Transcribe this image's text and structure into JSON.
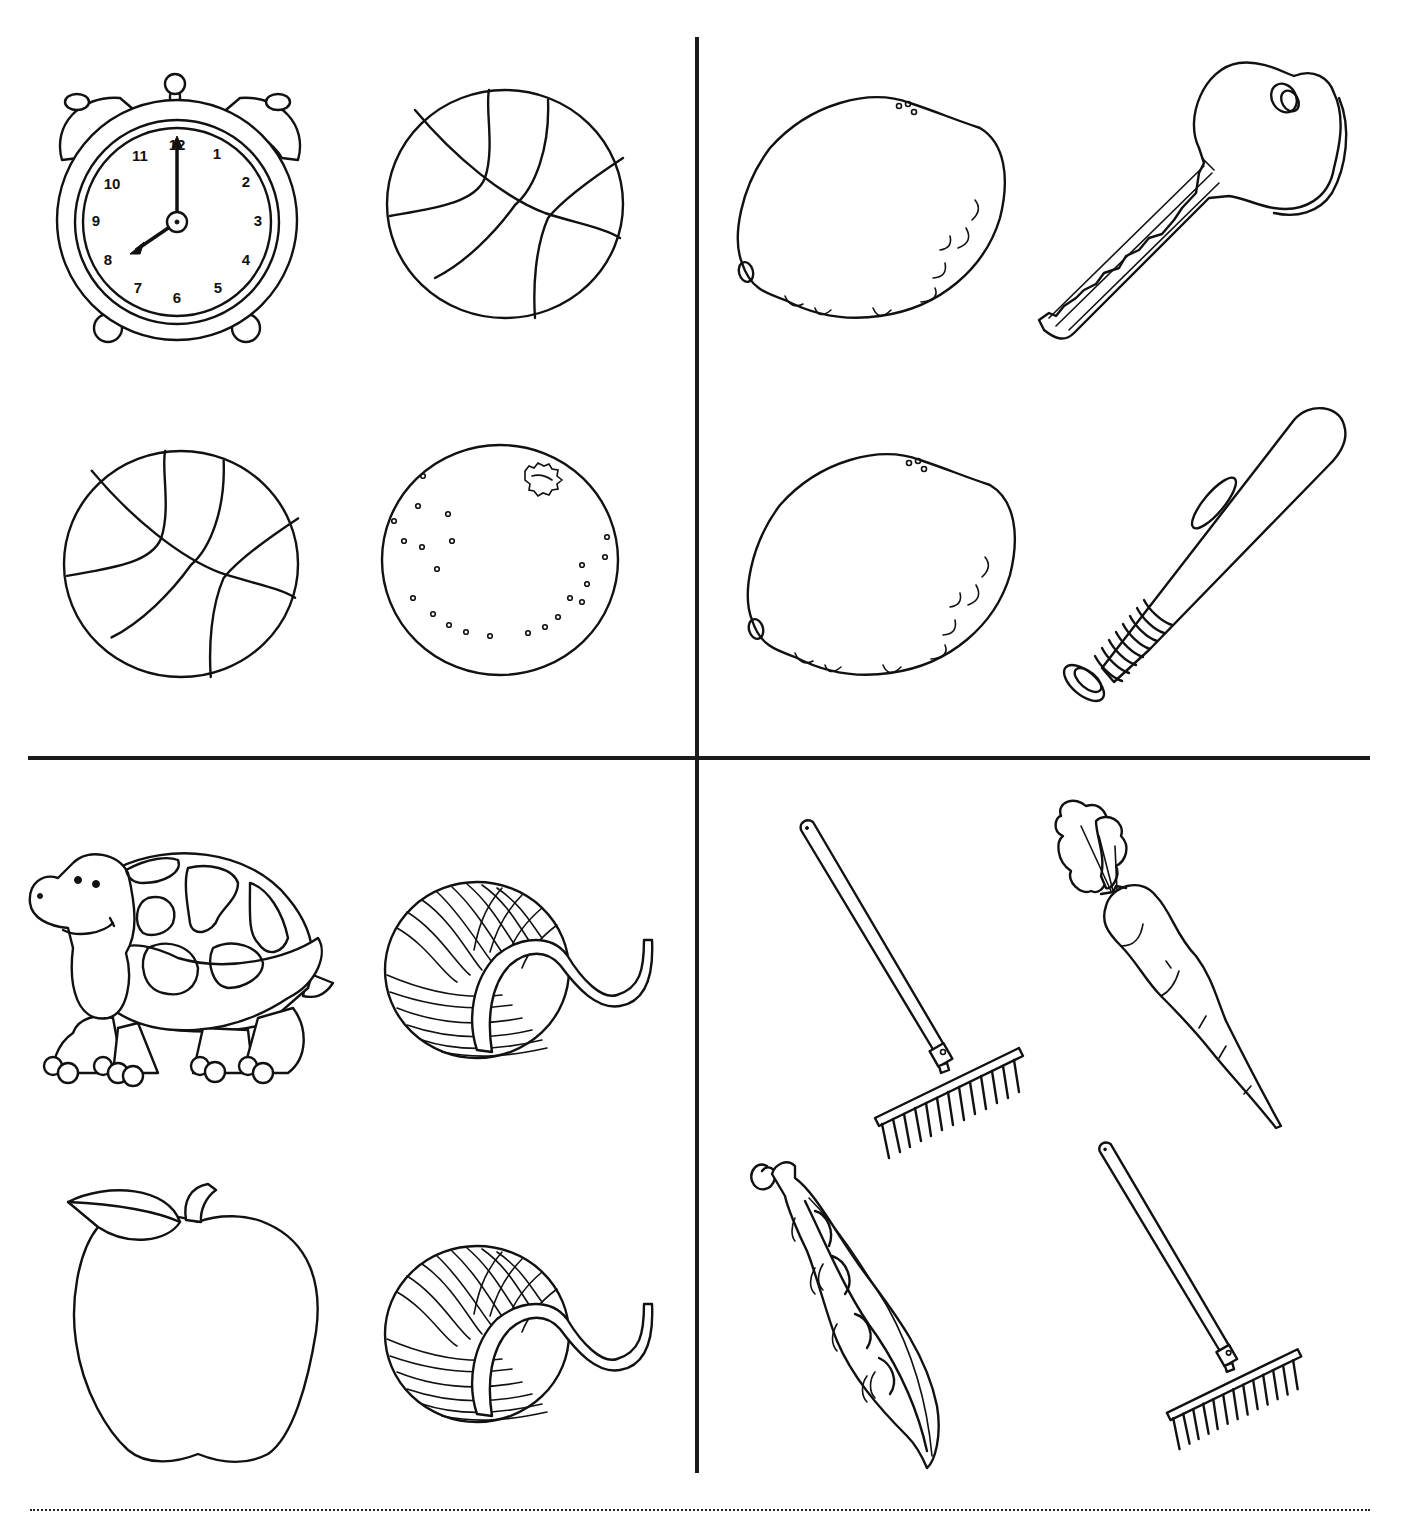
{
  "worksheet": {
    "type": "find-the-match",
    "layout": "2x2 grid of quadrants, 4 pictures each",
    "line_color": "#111111",
    "background": "#ffffff"
  },
  "quadrants": [
    {
      "position": "top-left",
      "items": [
        {
          "name": "alarm-clock",
          "label": "Alarm clock",
          "time_shown": "8:00",
          "dial_numbers": [
            "12",
            "1",
            "2",
            "3",
            "4",
            "5",
            "6",
            "7",
            "8",
            "9",
            "10",
            "11"
          ]
        },
        {
          "name": "basketball",
          "label": "Basketball"
        },
        {
          "name": "basketball",
          "label": "Basketball"
        },
        {
          "name": "orange",
          "label": "Orange"
        }
      ],
      "matching_pair": "basketball"
    },
    {
      "position": "top-right",
      "items": [
        {
          "name": "lemon",
          "label": "Lemon"
        },
        {
          "name": "key",
          "label": "Key"
        },
        {
          "name": "lemon",
          "label": "Lemon"
        },
        {
          "name": "baseball-bat",
          "label": "Baseball bat"
        }
      ],
      "matching_pair": "lemon"
    },
    {
      "position": "bottom-left",
      "items": [
        {
          "name": "turtle",
          "label": "Turtle"
        },
        {
          "name": "yarn-ball",
          "label": "Ball of yarn"
        },
        {
          "name": "apple",
          "label": "Apple"
        },
        {
          "name": "yarn-ball",
          "label": "Ball of yarn"
        }
      ],
      "matching_pair": "yarn-ball"
    },
    {
      "position": "bottom-right",
      "items": [
        {
          "name": "rake",
          "label": "Rake"
        },
        {
          "name": "carrot",
          "label": "Carrot"
        },
        {
          "name": "pea-pod",
          "label": "Pea pod"
        },
        {
          "name": "rake",
          "label": "Rake"
        }
      ],
      "matching_pair": "rake"
    }
  ],
  "footer": {
    "cut_line": "dotted"
  }
}
